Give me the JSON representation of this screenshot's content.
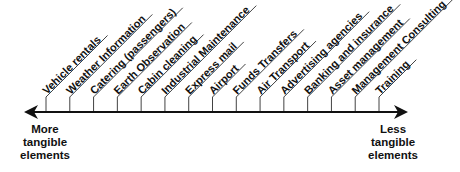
{
  "diagram": {
    "type": "tangibility-spectrum",
    "axis": {
      "left_label": [
        "More",
        "tangible",
        "elements"
      ],
      "right_label": [
        "Less",
        "tangible",
        "elements"
      ],
      "arrow_direction": "both",
      "color": "#111111"
    },
    "items": [
      {
        "label": "Vehicle rentals",
        "order": 1
      },
      {
        "label": "Weather Information",
        "order": 2
      },
      {
        "label": "Catering (passengers)",
        "order": 3
      },
      {
        "label": "Earth Observation",
        "order": 4
      },
      {
        "label": "Cabin cleaning",
        "order": 5
      },
      {
        "label": "Industrial Maintenance",
        "order": 6
      },
      {
        "label": "Express mail",
        "order": 7
      },
      {
        "label": "Airport",
        "order": 8
      },
      {
        "label": "Funds Transfers",
        "order": 9
      },
      {
        "label": "Air Transport",
        "order": 10
      },
      {
        "label": "Advertising agencies",
        "order": 11
      },
      {
        "label": "Banking and insurance",
        "order": 12
      },
      {
        "label": "Asset management",
        "order": 13
      },
      {
        "label": "Management Consulting",
        "order": 14
      },
      {
        "label": "Training",
        "order": 15
      }
    ]
  }
}
